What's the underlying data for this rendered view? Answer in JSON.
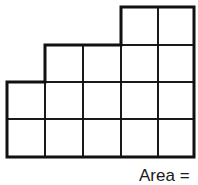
{
  "diagram": {
    "type": "grid-area-figure",
    "columns": 5,
    "rows": 4,
    "unit_squares_per_row_top_to_bottom": [
      2,
      4,
      5,
      5
    ],
    "filled_cells": [
      [
        0,
        3
      ],
      [
        0,
        4
      ],
      [
        1,
        1
      ],
      [
        1,
        2
      ],
      [
        1,
        3
      ],
      [
        1,
        4
      ],
      [
        2,
        0
      ],
      [
        2,
        1
      ],
      [
        2,
        2
      ],
      [
        2,
        3
      ],
      [
        2,
        4
      ],
      [
        3,
        0
      ],
      [
        3,
        1
      ],
      [
        3,
        2
      ],
      [
        3,
        3
      ],
      [
        3,
        4
      ]
    ],
    "line_color": "#111111",
    "outline_width": 3,
    "grid_width": 1.6
  },
  "label": {
    "text": "Area ="
  }
}
